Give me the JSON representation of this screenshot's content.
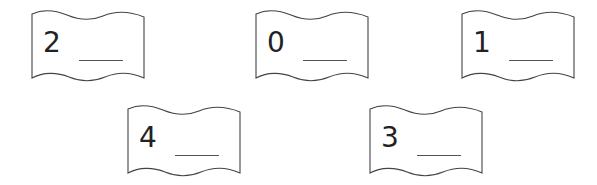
{
  "worksheet": {
    "cards": [
      {
        "digit": "2",
        "answer": "",
        "position": {
          "x": 31,
          "y": 10
        }
      },
      {
        "digit": "0",
        "answer": "",
        "position": {
          "x": 255,
          "y": 10
        }
      },
      {
        "digit": "1",
        "answer": "",
        "position": {
          "x": 461,
          "y": 10
        }
      },
      {
        "digit": "4",
        "answer": "",
        "position": {
          "x": 127,
          "y": 105
        }
      },
      {
        "digit": "3",
        "answer": "",
        "position": {
          "x": 369,
          "y": 105
        }
      }
    ]
  },
  "colors": {
    "stroke": "#444444",
    "text": "#222222",
    "background": "#ffffff"
  }
}
